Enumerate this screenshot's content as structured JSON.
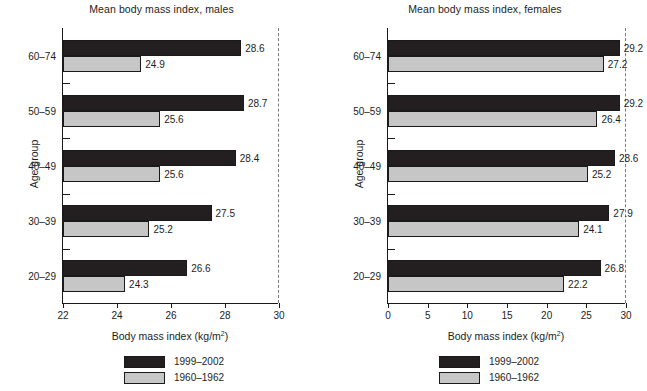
{
  "chart_data": [
    {
      "type": "bar",
      "orientation": "horizontal",
      "title": "Mean body mass index, males",
      "xlabel": "Body mass index (kg/m2)",
      "xlabel_base": "Body mass index (kg/m",
      "xlabel_sup": "2",
      "xlabel_tail": ")",
      "ylabel": "Age group",
      "categories": [
        "60–74",
        "50–59",
        "40–49",
        "30–39",
        "20–29"
      ],
      "xlim": [
        22,
        30
      ],
      "xticks": [
        22,
        24,
        26,
        28,
        30
      ],
      "xticklabels": [
        "22",
        "24",
        "26",
        "28",
        "30"
      ],
      "grid": false,
      "legend_position": "below",
      "series": [
        {
          "name": "1999–2002",
          "color": "#231f20",
          "values": [
            28.6,
            28.7,
            28.4,
            27.5,
            26.6
          ],
          "labels": [
            "28.6",
            "28.7",
            "28.4",
            "27.5",
            "26.6"
          ]
        },
        {
          "name": "1960–1962",
          "color": "#c6c6c6",
          "values": [
            24.9,
            25.6,
            25.6,
            25.2,
            24.3
          ],
          "labels": [
            "24.9",
            "25.6",
            "25.6",
            "25.2",
            "24.3"
          ]
        }
      ]
    },
    {
      "type": "bar",
      "orientation": "horizontal",
      "title": "Mean body mass index, females",
      "xlabel": "Body mass index (kg/m2)",
      "xlabel_base": "Body mass index (kg/m",
      "xlabel_sup": "2",
      "xlabel_tail": ")",
      "ylabel": "Age group",
      "categories": [
        "60–74",
        "50–59",
        "40–49",
        "30–39",
        "20–29"
      ],
      "xlim": [
        0,
        30
      ],
      "xticks": [
        0,
        5,
        10,
        15,
        20,
        25,
        30
      ],
      "xticklabels": [
        "0",
        "5",
        "10",
        "15",
        "20",
        "25",
        "30"
      ],
      "grid": false,
      "legend_position": "below",
      "series": [
        {
          "name": "1999–2002",
          "color": "#231f20",
          "values": [
            29.2,
            29.2,
            28.6,
            27.9,
            26.8
          ],
          "labels": [
            "29.2",
            "29.2",
            "28.6",
            "27.9",
            "26.8"
          ]
        },
        {
          "name": "1960–1962",
          "color": "#c6c6c6",
          "values": [
            27.2,
            26.4,
            25.2,
            24.1,
            22.2
          ],
          "labels": [
            "27.2",
            "26.4",
            "25.2",
            "24.1",
            "22.2"
          ]
        }
      ]
    }
  ],
  "panels": {
    "males": {
      "title": "Mean body mass index, males",
      "y_axis_title": "Age group",
      "x_axis_title_base": "Body mass index (kg/m",
      "x_axis_title_sup": "2",
      "x_axis_title_tail": ")",
      "categories": [
        "60–74",
        "50–59",
        "40–49",
        "30–39",
        "20–29"
      ],
      "xticklabels": [
        "22",
        "24",
        "26",
        "28",
        "30"
      ],
      "values_recent": [
        "28.6",
        "28.7",
        "28.4",
        "27.5",
        "26.6"
      ],
      "values_older": [
        "24.9",
        "25.6",
        "25.6",
        "25.2",
        "24.3"
      ],
      "legend": [
        {
          "label": "1999–2002",
          "color": "#231f20"
        },
        {
          "label": "1960–1962",
          "color": "#c6c6c6"
        }
      ]
    },
    "females": {
      "title": "Mean body mass index, females",
      "y_axis_title": "Age group",
      "x_axis_title_base": "Body mass index (kg/m",
      "x_axis_title_sup": "2",
      "x_axis_title_tail": ")",
      "categories": [
        "60–74",
        "50–59",
        "40–49",
        "30–39",
        "20–29"
      ],
      "xticklabels": [
        "0",
        "5",
        "10",
        "15",
        "20",
        "25",
        "30"
      ],
      "values_recent": [
        "29.2",
        "29.2",
        "28.6",
        "27.9",
        "26.8"
      ],
      "values_older": [
        "27.2",
        "26.4",
        "25.2",
        "24.1",
        "22.2"
      ],
      "legend": [
        {
          "label": "1999–2002",
          "color": "#231f20"
        },
        {
          "label": "1960–1962",
          "color": "#c6c6c6"
        }
      ]
    }
  }
}
